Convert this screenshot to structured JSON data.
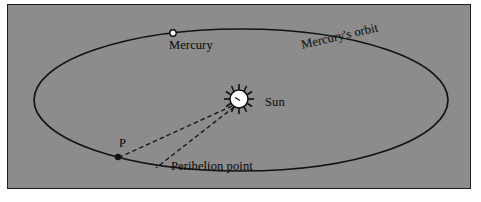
{
  "figure": {
    "panel_background": "#8c8c8c",
    "page_background": "#ffffff",
    "border_color": "#1c1c1c",
    "ink_color": "#121212"
  },
  "labels": {
    "mercury": "Mercury",
    "mercury_orbit": "Mercury's orbit",
    "sun": "Sun",
    "p": "P",
    "perihelion_point": "Perihelion point"
  },
  "diagram_data": {
    "type": "diagram",
    "subject": "Orbit of Mercury around the Sun",
    "elements": [
      {
        "name": "orbit-ellipse",
        "kind": "ellipse",
        "center": [
          233,
          95
        ],
        "rx": 207,
        "ry": 71,
        "stroke": "#121212",
        "fill": "none"
      },
      {
        "name": "sun",
        "kind": "star-circle",
        "center": [
          231,
          94
        ],
        "radius": 9,
        "fill": "#ffffff",
        "stroke": "#121212",
        "rays": 12,
        "ray_length": 6
      },
      {
        "name": "mercury-planet",
        "kind": "circle",
        "center": [
          165,
          28
        ],
        "radius": 3.2,
        "fill": "#ffffff",
        "stroke": "#121212"
      },
      {
        "name": "perihelion-point-p",
        "kind": "dot",
        "center": [
          110,
          152
        ],
        "radius": 3.2,
        "fill": "#121212"
      },
      {
        "name": "dashed-line-sun-to-p",
        "kind": "dashed-line",
        "from": [
          224,
          101
        ],
        "to": [
          112,
          152
        ],
        "stroke": "#121212"
      },
      {
        "name": "dashed-line-sun-to-perihelion-label",
        "kind": "dashed-line",
        "from": [
          226,
          102
        ],
        "to": [
          148,
          163
        ],
        "stroke": "#121212"
      }
    ]
  }
}
